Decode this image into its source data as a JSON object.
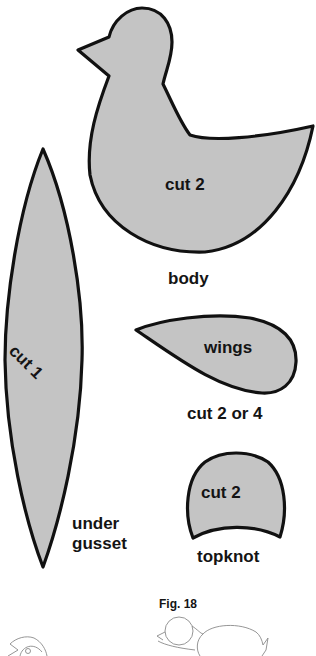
{
  "figure": {
    "caption": "Fig. 18",
    "fill_color": "#c4c4c4",
    "outline_color": "#111111"
  },
  "pieces": {
    "body": {
      "instruction": "cut 2",
      "name": "body"
    },
    "under_gusset": {
      "instruction": "cut 1",
      "name_line1": "under",
      "name_line2": "gusset"
    },
    "wings": {
      "name": "wings",
      "instruction": "cut 2 or 4"
    },
    "topknot": {
      "instruction": "cut 2",
      "name": "topknot"
    }
  }
}
